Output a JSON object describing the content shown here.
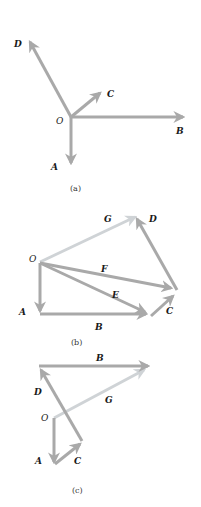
{
  "colors": {
    "vector": "#a9a9a9",
    "vector_light": "#cfd3d6",
    "label": "#1a1a1a"
  },
  "panels": [
    {
      "caption": "(a)",
      "origin_label": "O",
      "vectors": [
        {
          "name": "A",
          "label": "A"
        },
        {
          "name": "B",
          "label": "B"
        },
        {
          "name": "C",
          "label": "C"
        },
        {
          "name": "D",
          "label": "D"
        }
      ]
    },
    {
      "caption": "(b)",
      "origin_label": "O",
      "vectors": [
        {
          "name": "A",
          "label": "A"
        },
        {
          "name": "B",
          "label": "B"
        },
        {
          "name": "C",
          "label": "C"
        },
        {
          "name": "D",
          "label": "D"
        },
        {
          "name": "E",
          "label": "E"
        },
        {
          "name": "F",
          "label": "F"
        },
        {
          "name": "G",
          "label": "G"
        }
      ]
    },
    {
      "caption": "(c)",
      "origin_label": "O",
      "vectors": [
        {
          "name": "A",
          "label": "A"
        },
        {
          "name": "B",
          "label": "B"
        },
        {
          "name": "C",
          "label": "C"
        },
        {
          "name": "D",
          "label": "D"
        },
        {
          "name": "G",
          "label": "G"
        }
      ]
    }
  ]
}
